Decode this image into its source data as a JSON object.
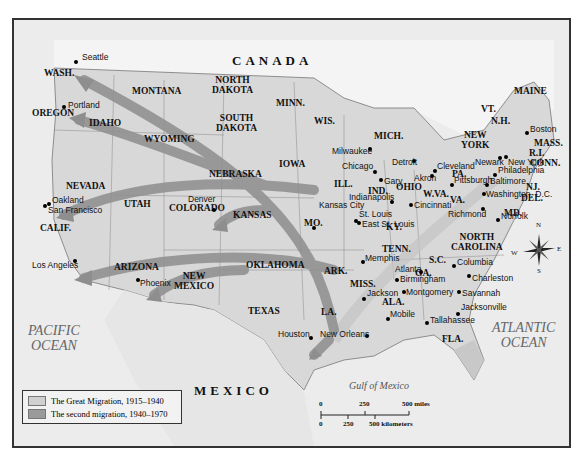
{
  "title_labels": {
    "canada": "CANADA",
    "mexico": "MEXICO"
  },
  "oceans": {
    "pacific": "PACIFIC\nOCEAN",
    "atlantic": "ATLANTIC\nOCEAN",
    "gulf": "Gulf of Mexico"
  },
  "states": [
    {
      "id": "wash",
      "label": "WASH.",
      "x": 60,
      "y": 72
    },
    {
      "id": "oregon",
      "label": "OREGON",
      "x": 48,
      "y": 112
    },
    {
      "id": "idaho",
      "label": "IDAHO",
      "x": 105,
      "y": 122
    },
    {
      "id": "montana",
      "label": "MONTANA",
      "x": 148,
      "y": 90
    },
    {
      "id": "wyoming",
      "label": "WYOMING",
      "x": 160,
      "y": 138
    },
    {
      "id": "north-dakota",
      "label": "NORTH\nDAKOTA",
      "x": 228,
      "y": 79
    },
    {
      "id": "south-dakota",
      "label": "SOUTH\nDAKOTA",
      "x": 232,
      "y": 117
    },
    {
      "id": "minn",
      "label": "MINN.",
      "x": 292,
      "y": 102
    },
    {
      "id": "wis",
      "label": "WIS.",
      "x": 330,
      "y": 120
    },
    {
      "id": "mich",
      "label": "MICH.",
      "x": 390,
      "y": 135
    },
    {
      "id": "iowa",
      "label": "IOWA",
      "x": 295,
      "y": 163
    },
    {
      "id": "nebraska",
      "label": "NEBRASKA",
      "x": 225,
      "y": 173
    },
    {
      "id": "nevada",
      "label": "NEVADA",
      "x": 82,
      "y": 185
    },
    {
      "id": "utah",
      "label": "UTAH",
      "x": 140,
      "y": 203
    },
    {
      "id": "colorado",
      "label": "COLORADO",
      "x": 185,
      "y": 207
    },
    {
      "id": "kansas",
      "label": "KANSAS",
      "x": 249,
      "y": 214
    },
    {
      "id": "calif",
      "label": "CALIF.",
      "x": 56,
      "y": 227
    },
    {
      "id": "ill",
      "label": "ILL.",
      "x": 350,
      "y": 183
    },
    {
      "id": "ind",
      "label": "IND.",
      "x": 384,
      "y": 190
    },
    {
      "id": "ohio",
      "label": "OHIO",
      "x": 412,
      "y": 186
    },
    {
      "id": "mo",
      "label": "MO.",
      "x": 320,
      "y": 222
    },
    {
      "id": "ky",
      "label": "KY.",
      "x": 402,
      "y": 226
    },
    {
      "id": "w-va",
      "label": "W.VA.",
      "x": 439,
      "y": 193
    },
    {
      "id": "va",
      "label": "VA.",
      "x": 466,
      "y": 199
    },
    {
      "id": "pa",
      "label": "PA.",
      "x": 468,
      "y": 173
    },
    {
      "id": "new-york",
      "label": "NEW\nYORK",
      "x": 477,
      "y": 134
    },
    {
      "id": "vt",
      "label": "VT.",
      "x": 497,
      "y": 108
    },
    {
      "id": "nh",
      "label": "N.H.",
      "x": 507,
      "y": 120
    },
    {
      "id": "maine",
      "label": "MAINE",
      "x": 530,
      "y": 90
    },
    {
      "id": "mass",
      "label": "MASS.",
      "x": 550,
      "y": 142
    },
    {
      "id": "ri",
      "label": "R.I.",
      "x": 545,
      "y": 152
    },
    {
      "id": "conn",
      "label": "CONN.",
      "x": 546,
      "y": 162
    },
    {
      "id": "nj",
      "label": "NJ.",
      "x": 542,
      "y": 186
    },
    {
      "id": "del",
      "label": "DEL.",
      "x": 537,
      "y": 197
    },
    {
      "id": "md",
      "label": "MD.",
      "x": 520,
      "y": 212
    },
    {
      "id": "north-carolina",
      "label": "NORTH\nCAROLINA",
      "x": 467,
      "y": 236
    },
    {
      "id": "tenn",
      "label": "TENN.",
      "x": 398,
      "y": 248
    },
    {
      "id": "sc",
      "label": "S.C.",
      "x": 445,
      "y": 259
    },
    {
      "id": "ark",
      "label": "ARK.",
      "x": 340,
      "y": 270
    },
    {
      "id": "oklahoma",
      "label": "OKLAHOMA",
      "x": 262,
      "y": 264
    },
    {
      "id": "arizona",
      "label": "ARIZONA",
      "x": 130,
      "y": 266
    },
    {
      "id": "new-mexico",
      "label": "NEW\nMEXICO",
      "x": 190,
      "y": 275
    },
    {
      "id": "ga",
      "label": "GA.",
      "x": 431,
      "y": 272
    },
    {
      "id": "miss",
      "label": "MISS.",
      "x": 366,
      "y": 283
    },
    {
      "id": "ala",
      "label": "ALA.",
      "x": 398,
      "y": 301
    },
    {
      "id": "texas",
      "label": "TEXAS",
      "x": 264,
      "y": 310
    },
    {
      "id": "la",
      "label": "LA.",
      "x": 337,
      "y": 311
    },
    {
      "id": "fla",
      "label": "FLA.",
      "x": 458,
      "y": 338
    }
  ],
  "cities": [
    {
      "name": "Seattle",
      "dx": 74,
      "dy": 60,
      "lx": 80,
      "ly": 55
    },
    {
      "name": "Portland",
      "dx": 62,
      "dy": 105,
      "lx": 66,
      "ly": 103
    },
    {
      "name": "Oakland",
      "dx": 47,
      "dy": 202,
      "lx": 50,
      "ly": 198
    },
    {
      "name": "San Francisco",
      "dx": 43,
      "dy": 204,
      "lx": 46,
      "ly": 208
    },
    {
      "name": "Los Angeles",
      "dx": 73,
      "dy": 259,
      "lx": 30,
      "ly": 263
    },
    {
      "name": "Phoenix",
      "dx": 136,
      "dy": 278,
      "lx": 138,
      "ly": 281
    },
    {
      "name": "Denver",
      "dx": 212,
      "dy": 208,
      "lx": 186,
      "ly": 197
    },
    {
      "name": "Milwaukee",
      "dx": 368,
      "dy": 147,
      "lx": 330,
      "ly": 149
    },
    {
      "name": "Chicago",
      "dx": 373,
      "dy": 170,
      "lx": 340,
      "ly": 164
    },
    {
      "name": "Detroit",
      "dx": 412,
      "dy": 159,
      "lx": 390,
      "ly": 160
    },
    {
      "name": "Gary",
      "dx": 379,
      "dy": 178,
      "lx": 382,
      "ly": 179
    },
    {
      "name": "Indianapolis",
      "dx": 390,
      "dy": 200,
      "lx": 347,
      "ly": 195
    },
    {
      "name": "Kansas City",
      "dx": 312,
      "dy": 226,
      "lx": 317,
      "ly": 203
    },
    {
      "name": "St. Louis",
      "dx": 354,
      "dy": 219,
      "lx": 357,
      "ly": 212
    },
    {
      "name": "East St. Louis",
      "dx": 357,
      "dy": 221,
      "lx": 360,
      "ly": 222
    },
    {
      "name": "Cleveland",
      "dx": 433,
      "dy": 169,
      "lx": 435,
      "ly": 164
    },
    {
      "name": "Akron",
      "dx": 430,
      "dy": 174,
      "lx": 412,
      "ly": 176
    },
    {
      "name": "Cincinnati",
      "dx": 409,
      "dy": 203,
      "lx": 412,
      "ly": 203
    },
    {
      "name": "Pittsburgh",
      "dx": 450,
      "dy": 183,
      "lx": 452,
      "ly": 178
    },
    {
      "name": "Newark",
      "dx": 498,
      "dy": 156,
      "lx": 473,
      "ly": 160
    },
    {
      "name": "New York",
      "dx": 504,
      "dy": 155,
      "lx": 506,
      "ly": 160
    },
    {
      "name": "Philadelphia",
      "dx": 493,
      "dy": 173,
      "lx": 496,
      "ly": 168
    },
    {
      "name": "Baltimore",
      "dx": 485,
      "dy": 183,
      "lx": 488,
      "ly": 179
    },
    {
      "name": "Washington, D.C.",
      "dx": 482,
      "dy": 192,
      "lx": 484,
      "ly": 192
    },
    {
      "name": "Boston",
      "dx": 525,
      "dy": 131,
      "lx": 528,
      "ly": 127
    },
    {
      "name": "Richmond",
      "dx": 481,
      "dy": 207,
      "lx": 446,
      "ly": 212
    },
    {
      "name": "Norfolk",
      "dx": 496,
      "dy": 218,
      "lx": 499,
      "ly": 214
    },
    {
      "name": "Memphis",
      "dx": 361,
      "dy": 260,
      "lx": 363,
      "ly": 256
    },
    {
      "name": "Columbia",
      "dx": 452,
      "dy": 264,
      "lx": 455,
      "ly": 260
    },
    {
      "name": "Atlanta",
      "dx": 419,
      "dy": 270,
      "lx": 393,
      "ly": 267
    },
    {
      "name": "Birmingham",
      "dx": 395,
      "dy": 278,
      "lx": 398,
      "ly": 277
    },
    {
      "name": "Charleston",
      "dx": 467,
      "dy": 274,
      "lx": 470,
      "ly": 276
    },
    {
      "name": "Jackson",
      "dx": 362,
      "dy": 297,
      "lx": 365,
      "ly": 291
    },
    {
      "name": "Montgomery",
      "dx": 402,
      "dy": 290,
      "lx": 404,
      "ly": 290
    },
    {
      "name": "Savannah",
      "dx": 457,
      "dy": 290,
      "lx": 460,
      "ly": 291
    },
    {
      "name": "Mobile",
      "dx": 386,
      "dy": 317,
      "lx": 388,
      "ly": 312
    },
    {
      "name": "Jacksonville",
      "dx": 456,
      "dy": 312,
      "lx": 459,
      "ly": 305
    },
    {
      "name": "Tallahassee",
      "dx": 425,
      "dy": 321,
      "lx": 428,
      "ly": 318
    },
    {
      "name": "Houston",
      "dx": 309,
      "dy": 336,
      "lx": 276,
      "ly": 332
    },
    {
      "name": "New Orleans",
      "dx": 365,
      "dy": 334,
      "lx": 318,
      "ly": 332
    }
  ],
  "legend": {
    "items": [
      {
        "label": "The Great Migration, 1915–1940",
        "color": "#d0d0d0"
      },
      {
        "label": "The second migration, 1940–1970",
        "color": "#9a9a9a"
      }
    ]
  },
  "scale": {
    "miles": [
      "0",
      "250",
      "500 miles"
    ],
    "km": [
      "0",
      "250",
      "500 kilometers"
    ]
  },
  "compass": {
    "n": "N",
    "s": "S",
    "e": "E",
    "w": "W"
  },
  "colors": {
    "land": "#d6d6d6",
    "sea": "#ececec",
    "great_migration": "#c4c4c4",
    "second_migration": "#8e8e8e",
    "border": "#555555"
  }
}
